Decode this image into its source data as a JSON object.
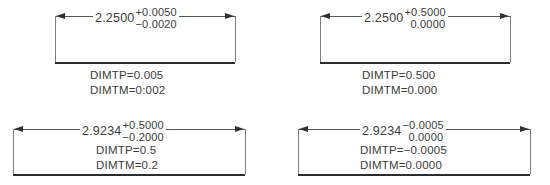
{
  "figures": [
    {
      "id": "example-top-left",
      "nominal": "2.2500",
      "upper_tolerance": "+0.0050",
      "lower_tolerance": "−0.0020",
      "lower_has_sign": true,
      "dimtp": "DIMTP=0.005",
      "dimtm": "DIMTM=0:002"
    },
    {
      "id": "example-top-right",
      "nominal": "2.2500",
      "upper_tolerance": "+0.5000",
      "lower_tolerance": "0.0000",
      "lower_has_sign": false,
      "dimtp": "DIMTP=0.500",
      "dimtm": "DIMTM=0.000"
    },
    {
      "id": "example-bottom-left",
      "nominal": "2.9234",
      "upper_tolerance": "+0.5000",
      "lower_tolerance": "−0.2000",
      "lower_has_sign": true,
      "dimtp": "DIMTP=0.5",
      "dimtm": "DIMTM=0.2"
    },
    {
      "id": "example-bottom-right",
      "nominal": "2.9234",
      "upper_tolerance": "−0.0005",
      "lower_tolerance": "0.0000",
      "lower_has_sign": false,
      "dimtp": "DIMTP=−0.0005",
      "dimtm": "DIMTM=0.0000"
    }
  ],
  "colors": {
    "line": "#555a5e",
    "extension_line": "#7b8084",
    "arrow": "#2e3133",
    "baseline": "#2b2e30",
    "text": "#3c3c3c",
    "background": "#ffffff"
  }
}
